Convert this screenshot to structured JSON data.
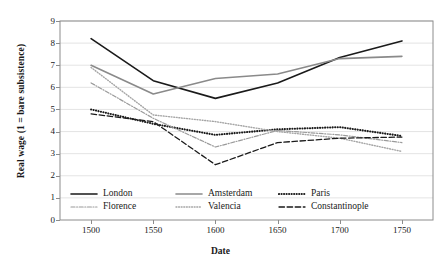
{
  "chart_data": {
    "type": "line",
    "title": "",
    "xlabel": "Date",
    "ylabel": "Real wage (1 = bare subsistence)",
    "x": [
      1500,
      1550,
      1600,
      1650,
      1700,
      1750
    ],
    "xticklabels": [
      "1500",
      "1550",
      "1600",
      "1650",
      "1700",
      "1750"
    ],
    "yticklabels": [
      "0",
      "1",
      "2",
      "3",
      "4",
      "5",
      "6",
      "7",
      "8",
      "9"
    ],
    "xlim": [
      1475,
      1775
    ],
    "ylim": [
      0,
      9
    ],
    "grid": "horizontal",
    "legend_position": "inside-bottom-left",
    "series": [
      {
        "name": "London",
        "values": [
          8.2,
          6.3,
          5.5,
          6.2,
          7.35,
          8.1
        ],
        "color": "#1a1a1a",
        "style": "solid",
        "width": 1.6
      },
      {
        "name": "Amsterdam",
        "values": [
          7.0,
          5.7,
          6.4,
          6.6,
          7.3,
          7.4
        ],
        "color": "#8a8a8a",
        "style": "solid",
        "width": 1.6
      },
      {
        "name": "Paris",
        "values": [
          5.0,
          4.35,
          3.85,
          4.1,
          4.2,
          3.8
        ],
        "color": "#1a1a1a",
        "style": "dotted",
        "width": 2.1
      },
      {
        "name": "Florence",
        "values": [
          6.2,
          4.6,
          3.3,
          4.05,
          3.85,
          3.5
        ],
        "color": "#9a9a9a",
        "style": "dashdot",
        "width": 1.2
      },
      {
        "name": "Valencia",
        "values": [
          6.9,
          4.75,
          4.45,
          4.0,
          3.7,
          3.1
        ],
        "color": "#a5a5a5",
        "style": "fine-dotted",
        "width": 1.4
      },
      {
        "name": "Constantinople",
        "values": [
          4.8,
          4.45,
          2.5,
          3.5,
          3.7,
          3.75
        ],
        "color": "#1a1a1a",
        "style": "dashed",
        "width": 1.3
      }
    ]
  },
  "axis": {
    "ylabel": "Real wage (1 = bare subsistence)",
    "xlabel": "Date"
  },
  "legend": {
    "entries": [
      {
        "label": "London"
      },
      {
        "label": "Amsterdam"
      },
      {
        "label": "Paris"
      },
      {
        "label": "Florence"
      },
      {
        "label": "Valencia"
      },
      {
        "label": "Constantinople"
      }
    ]
  }
}
